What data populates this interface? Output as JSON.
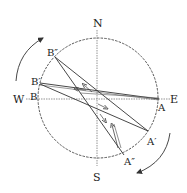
{
  "diagram": {
    "type": "compass-rotation-diagram",
    "compass": {
      "north": "N",
      "south": "S",
      "west": "W",
      "east": "E"
    },
    "points": {
      "B": "B",
      "B1": "B′",
      "B2": "B″",
      "A": "A",
      "A1": "A′",
      "A2": "A″"
    },
    "colors": {
      "stroke": "#333333",
      "circle": "#444444",
      "axis": "#666666",
      "background": "#ffffff"
    },
    "rotation_arrows": [
      "clockwise-upper-left",
      "clockwise-lower-right"
    ]
  }
}
